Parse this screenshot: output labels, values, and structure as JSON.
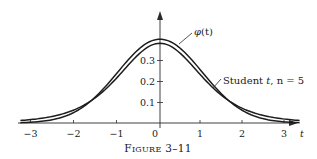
{
  "chart_data": {
    "type": "line",
    "title": "",
    "caption": {
      "prefix_big": "F",
      "prefix_small": "IGURE",
      "number": " 3–11"
    },
    "xlabel": "t",
    "ylabel": "",
    "xlim": [
      -3.3,
      3.3
    ],
    "ylim": [
      0,
      0.45
    ],
    "x_ticks": [
      -3,
      -2,
      -1,
      0,
      1,
      2,
      3
    ],
    "x_tick_labels": [
      "−3",
      "−2",
      "−1",
      "0",
      "1",
      "2",
      "3"
    ],
    "y_ticks": [
      0.1,
      0.2,
      0.3
    ],
    "y_tick_labels": [
      "0.1",
      "0.2",
      "0.3"
    ],
    "grid": false,
    "legend": "none (direct labels with leader lines)",
    "series": [
      {
        "name": "φ(t)",
        "description": "standard normal density",
        "x": [
          -3,
          -2.5,
          -2,
          -1.5,
          -1,
          -0.5,
          0,
          0.5,
          1,
          1.5,
          2,
          2.5,
          3
        ],
        "values": [
          0.0044,
          0.0175,
          0.054,
          0.1295,
          0.242,
          0.3521,
          0.3989,
          0.3521,
          0.242,
          0.1295,
          0.054,
          0.0175,
          0.0044
        ]
      },
      {
        "name": "Student t, n = 5",
        "description": "Student t density, 5 degrees of freedom",
        "x": [
          -3,
          -2.5,
          -2,
          -1.5,
          -1,
          -0.5,
          0,
          0.5,
          1,
          1.5,
          2,
          2.5,
          3
        ],
        "values": [
          0.0173,
          0.0329,
          0.0651,
          0.1245,
          0.2197,
          0.3279,
          0.3796,
          0.3279,
          0.2197,
          0.1245,
          0.0651,
          0.0329,
          0.0173
        ]
      }
    ],
    "annotations": [
      {
        "text_main": "φ",
        "text_rest": "(t)",
        "points_to": "normal curve near peak"
      },
      {
        "text_main": "Student ",
        "text_t": "t",
        "text_rest": ", n = 5",
        "points_to": "Student t curve right shoulder"
      }
    ]
  }
}
